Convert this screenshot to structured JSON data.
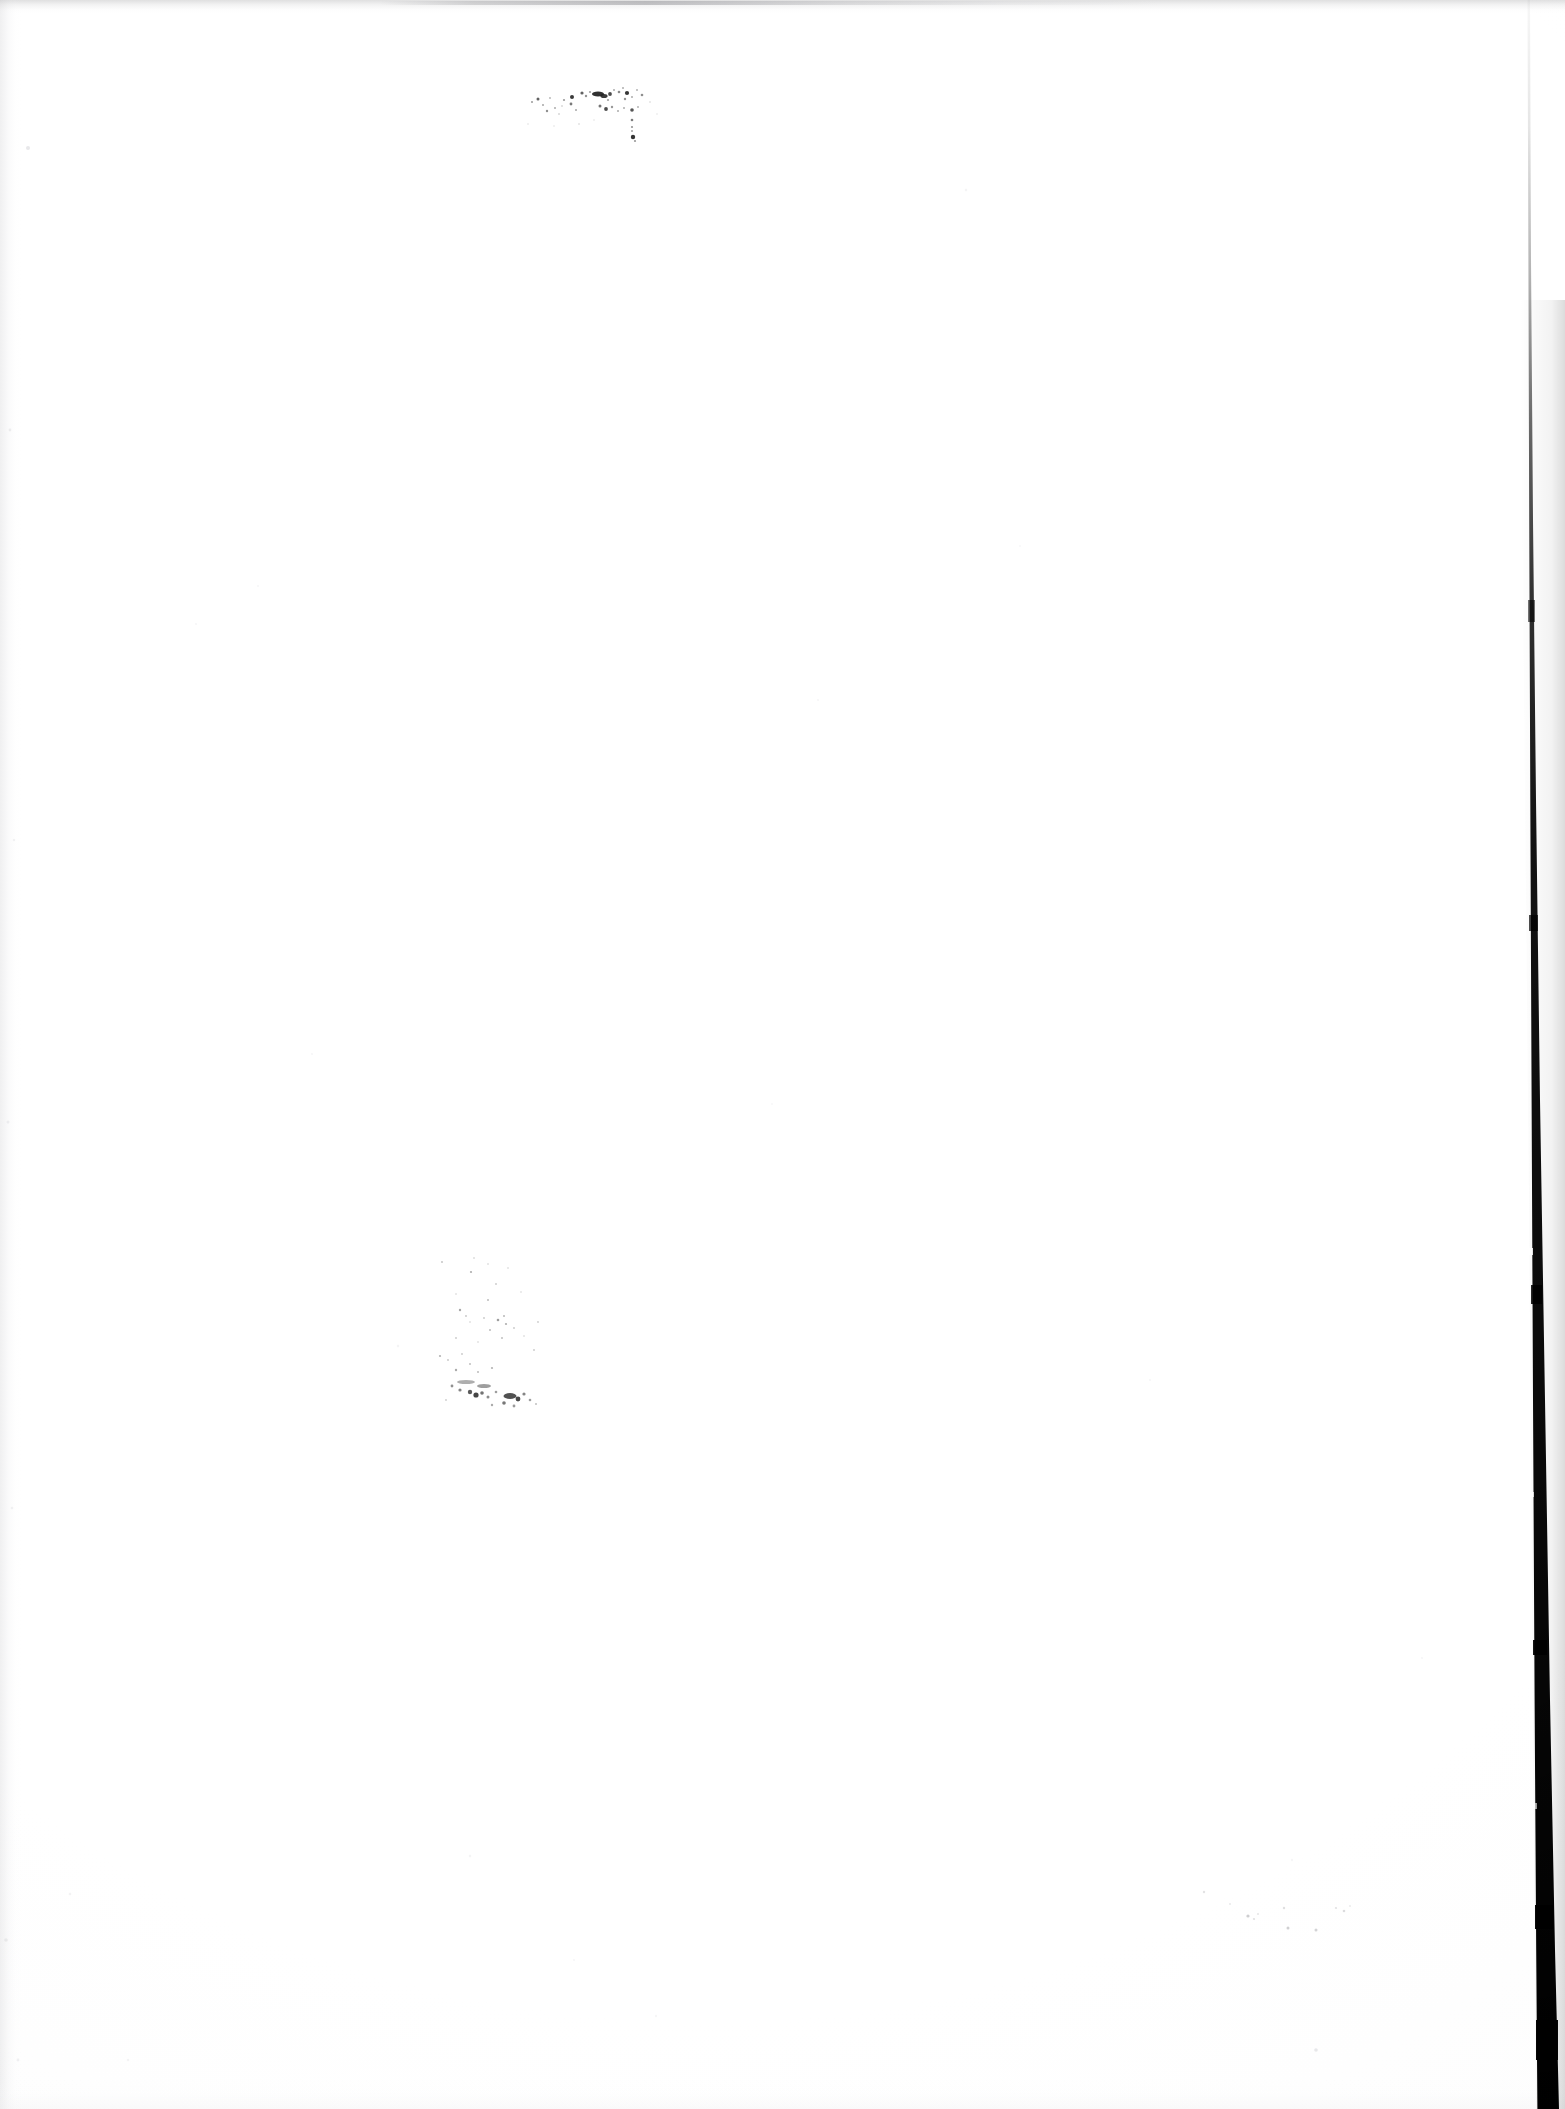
{
  "document": {
    "kind": "scanned-page",
    "title": "Scanned blank page",
    "page_width": 1565,
    "page_height": 2109,
    "background_color": "#ffffff",
    "ink_color": "#1a1a1a",
    "content_text": "",
    "visible_text": "",
    "description": "Blank scanned sheet of paper with no legible text; faint ink speckles near the top and in the lower-left quadrant, and a dark page-edge shadow along the right side."
  },
  "artifacts": {
    "right_edge_shadow": {
      "name": "page-edge-shadow",
      "color": "#000000",
      "top_x": 1528,
      "bottom_x": 1547,
      "top_width": 1,
      "bottom_width": 22,
      "note": "Dark scanner shadow at the bound/right edge of the sheet; faint at top, thickening and darkening toward the bottom."
    },
    "top_edge_streak": {
      "name": "scan-edge-top-streak",
      "color": "#8c8c90",
      "y": 0,
      "height": 14
    },
    "left_edge_streak": {
      "name": "scan-edge-left-streak",
      "color": "#c4c4c8",
      "x": 0,
      "width": 22
    },
    "speckle_clusters": [
      {
        "name": "top-speckle-cluster",
        "x": 530,
        "y": 86,
        "width": 130,
        "height": 64,
        "density": "moderate",
        "color": "#1f1f1f",
        "note": "Scattered dark dots, possibly a smudged handwritten mark or scanner debris."
      },
      {
        "name": "lower-left-speckle-cluster",
        "x": 430,
        "y": 1255,
        "width": 110,
        "height": 160,
        "density": "light-diffuse",
        "color": "#3a3a3a",
        "note": "Diffuse faint stipple smudge trailing down and to the right."
      },
      {
        "name": "bottom-right-faint-specks",
        "x": 1190,
        "y": 1888,
        "width": 200,
        "height": 60,
        "density": "very-light",
        "color": "#9a9aa0",
        "note": "A few very faint isolated specks."
      }
    ]
  }
}
